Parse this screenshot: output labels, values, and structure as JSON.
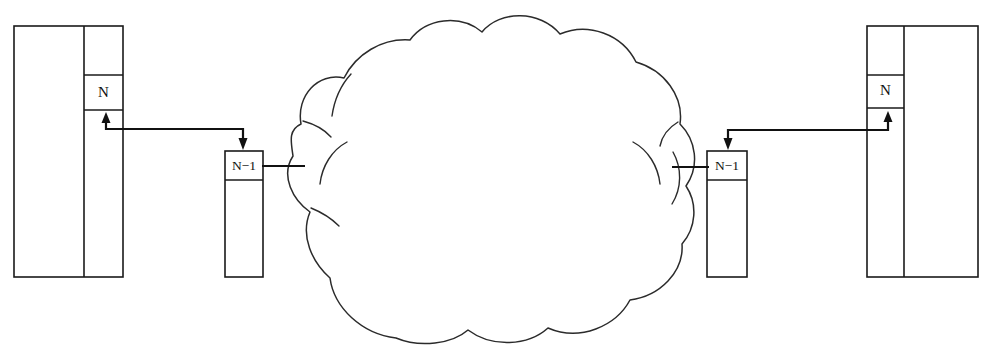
{
  "diagram": {
    "canvas": {
      "width": 989,
      "height": 349,
      "background": "#ffffff"
    },
    "stroke_color": "#1a1a1a",
    "line_color": "#111111",
    "cloud_stroke": "#2b2b2b",
    "fill_color": "#ffffff"
  },
  "nodes": {
    "left_host": {
      "name": "left-host-stack",
      "label": "",
      "top_layer_label": "N",
      "x": 14,
      "y": 26,
      "width": 109,
      "height": 251,
      "column_split_x": 84,
      "layer_cell": {
        "x": 84,
        "y": 75,
        "width": 39,
        "height": 35
      }
    },
    "left_router": {
      "name": "left-router-stack",
      "top_layer_label": "N−1",
      "x": 225,
      "y": 151,
      "width": 38,
      "height": 126,
      "header_split_y": 180
    },
    "right_router": {
      "name": "right-router-stack",
      "top_layer_label": "N−1",
      "x": 707,
      "y": 151,
      "width": 40,
      "height": 126,
      "header_split_y": 180
    },
    "right_host": {
      "name": "right-host-stack",
      "top_layer_label": "N",
      "x": 867,
      "y": 26,
      "width": 111,
      "height": 251,
      "column_split_x": 904,
      "layer_cell": {
        "x": 867,
        "y": 75,
        "width": 37,
        "height": 33
      }
    }
  },
  "cloud": {
    "name": "network-cloud",
    "label": "",
    "bounds": {
      "left": 293,
      "top": 13,
      "right": 686,
      "bottom": 340
    },
    "left_attach": {
      "x": 293,
      "y": 166
    },
    "right_attach": {
      "x": 686,
      "y": 167
    }
  },
  "connectors": [
    {
      "name": "left-peer-link",
      "from": "left-router",
      "to": "left-host-layer-n",
      "up_arrow_x": 106,
      "up_arrow_tip_y": 113,
      "horizontal_y": 129,
      "down_arrow_x": 243,
      "down_arrow_tip_y": 149,
      "arrow_from_label": "N−1",
      "arrow_to_label": "N"
    },
    {
      "name": "right-peer-link",
      "from": "right-router",
      "to": "right-host-layer-n",
      "up_arrow_x": 888,
      "up_arrow_tip_y": 112,
      "horizontal_y": 130,
      "down_arrow_x": 728,
      "down_arrow_tip_y": 149,
      "arrow_from_label": "N−1",
      "arrow_to_label": "N"
    },
    {
      "name": "left-cloud-link",
      "from_x": 263,
      "to_x": 300,
      "y": 166
    },
    {
      "name": "right-cloud-link",
      "from_x": 678,
      "to_x": 709,
      "y": 167
    }
  ],
  "labels": {
    "layer_n": "N",
    "layer_n_minus_1": "N−1"
  }
}
